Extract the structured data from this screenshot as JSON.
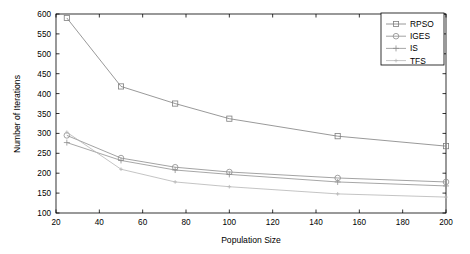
{
  "chart_data": {
    "type": "line",
    "title": "",
    "xlabel": "Population Size",
    "ylabel": "Number of Iterations",
    "xlim": [
      20,
      200
    ],
    "ylim": [
      100,
      600
    ],
    "xticks": [
      20,
      40,
      60,
      80,
      100,
      120,
      140,
      160,
      180,
      200
    ],
    "yticks": [
      100,
      150,
      200,
      250,
      300,
      350,
      400,
      450,
      500,
      550,
      600
    ],
    "xtick_labels": [
      "20",
      "40",
      "60",
      "80",
      "100",
      "120",
      "140",
      "160",
      "180",
      "200"
    ],
    "ytick_labels": [
      "100",
      "150",
      "200",
      "250",
      "300",
      "350",
      "400",
      "450",
      "500",
      "550",
      "600"
    ],
    "grid": false,
    "legend_position": "top-right",
    "x": [
      25,
      50,
      75,
      100,
      150,
      200
    ],
    "series": [
      {
        "name": "RPSO",
        "marker": "square",
        "color": "#7f7f7f",
        "values": [
          590,
          418,
          375,
          337,
          293,
          268
        ]
      },
      {
        "name": "IGES",
        "marker": "circle",
        "color": "#8c8c8c",
        "values": [
          295,
          238,
          215,
          203,
          188,
          178
        ]
      },
      {
        "name": "IS",
        "marker": "plus",
        "color": "#909090",
        "values": [
          277,
          232,
          208,
          197,
          178,
          168
        ]
      },
      {
        "name": "TFS",
        "marker": "dot",
        "color": "#b5b5b5",
        "values": [
          303,
          210,
          178,
          166,
          148,
          140
        ]
      }
    ]
  },
  "legend": {
    "items": [
      {
        "label": "RPSO"
      },
      {
        "label": "IGES"
      },
      {
        "label": "IS"
      },
      {
        "label": "TFS"
      }
    ]
  },
  "axes": {
    "x_title": "Population Size",
    "y_title": "Number of Iterations"
  }
}
